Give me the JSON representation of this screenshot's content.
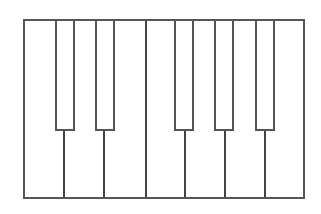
{
  "diagram": {
    "type": "piano-keyboard",
    "octave_count": 1,
    "colors": {
      "outline": "#555555",
      "key_fill": "#ffffff",
      "background": "#ffffff"
    },
    "white_keys": [
      {
        "note": "C",
        "left": 0,
        "width": 40
      },
      {
        "note": "D",
        "left": 40,
        "width": 40
      },
      {
        "note": "E",
        "left": 80,
        "width": 42
      },
      {
        "note": "F",
        "left": 122,
        "width": 39
      },
      {
        "note": "G",
        "left": 161,
        "width": 40
      },
      {
        "note": "A",
        "left": 201,
        "width": 40
      },
      {
        "note": "B",
        "left": 241,
        "width": 37
      }
    ],
    "black_keys": [
      {
        "note": "C#",
        "left": 30
      },
      {
        "note": "D#",
        "left": 70
      },
      {
        "note": "F#",
        "left": 149
      },
      {
        "note": "G#",
        "left": 189
      },
      {
        "note": "A#",
        "left": 230
      }
    ]
  }
}
